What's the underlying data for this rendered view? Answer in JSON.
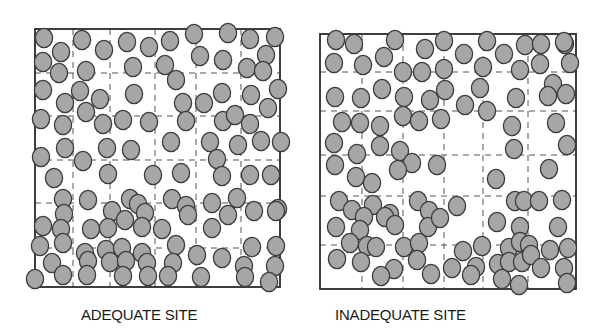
{
  "figure": {
    "panels": [
      {
        "id": "adequate",
        "caption": "ADEQUATE SITE",
        "box": {
          "x": 35,
          "y": 29,
          "w": 245,
          "h": 258
        },
        "grid": {
          "cols": [
            73,
            110,
            155,
            196,
            241
          ],
          "rows": [
            73,
            116,
            160,
            203,
            248
          ]
        },
        "circles": [
          [
            44,
            38
          ],
          [
            61,
            52
          ],
          [
            82,
            40
          ],
          [
            104,
            50
          ],
          [
            127,
            42
          ],
          [
            149,
            47
          ],
          [
            170,
            41
          ],
          [
            194,
            34
          ],
          [
            228,
            33
          ],
          [
            250,
            39
          ],
          [
            275,
            37
          ],
          [
            43,
            62
          ],
          [
            59,
            73
          ],
          [
            86,
            71
          ],
          [
            133,
            67
          ],
          [
            165,
            65
          ],
          [
            200,
            56
          ],
          [
            223,
            60
          ],
          [
            247,
            68
          ],
          [
            266,
            55
          ],
          [
            263,
            71
          ],
          [
            43,
            90
          ],
          [
            65,
            103
          ],
          [
            80,
            91
          ],
          [
            100,
            99
          ],
          [
            134,
            94
          ],
          [
            176,
            80
          ],
          [
            183,
            103
          ],
          [
            204,
            103
          ],
          [
            222,
            93
          ],
          [
            251,
            95
          ],
          [
            278,
            89
          ],
          [
            41,
            119
          ],
          [
            63,
            125
          ],
          [
            86,
            112
          ],
          [
            103,
            124
          ],
          [
            123,
            120
          ],
          [
            149,
            122
          ],
          [
            186,
            121
          ],
          [
            223,
            121
          ],
          [
            235,
            115
          ],
          [
            250,
            124
          ],
          [
            268,
            108
          ],
          [
            65,
            148
          ],
          [
            107,
            148
          ],
          [
            131,
            150
          ],
          [
            171,
            142
          ],
          [
            210,
            142
          ],
          [
            238,
            145
          ],
          [
            261,
            141
          ],
          [
            281,
            142
          ],
          [
            41,
            157
          ],
          [
            83,
            161
          ],
          [
            108,
            174
          ],
          [
            153,
            175
          ],
          [
            181,
            173
          ],
          [
            217,
            159
          ],
          [
            222,
            176
          ],
          [
            250,
            175
          ],
          [
            271,
            175
          ],
          [
            54,
            178
          ],
          [
            63,
            199
          ],
          [
            64,
            214
          ],
          [
            88,
            200
          ],
          [
            112,
            211
          ],
          [
            130,
            199
          ],
          [
            138,
            204
          ],
          [
            145,
            213
          ],
          [
            172,
            199
          ],
          [
            186,
            206
          ],
          [
            212,
            203
          ],
          [
            237,
            198
          ],
          [
            254,
            211
          ],
          [
            278,
            209
          ],
          [
            43,
            226
          ],
          [
            61,
            229
          ],
          [
            91,
            229
          ],
          [
            108,
            228
          ],
          [
            125,
            220
          ],
          [
            142,
            227
          ],
          [
            162,
            229
          ],
          [
            188,
            215
          ],
          [
            212,
            228
          ],
          [
            228,
            215
          ],
          [
            276,
            211
          ],
          [
            40,
            246
          ],
          [
            63,
            243
          ],
          [
            85,
            253
          ],
          [
            106,
            250
          ],
          [
            122,
            248
          ],
          [
            142,
            253
          ],
          [
            176,
            245
          ],
          [
            197,
            255
          ],
          [
            252,
            247
          ],
          [
            276,
            246
          ],
          [
            52,
            263
          ],
          [
            88,
            261
          ],
          [
            110,
            262
          ],
          [
            126,
            261
          ],
          [
            147,
            263
          ],
          [
            173,
            263
          ],
          [
            222,
            258
          ],
          [
            244,
            266
          ],
          [
            275,
            266
          ],
          [
            35,
            279
          ],
          [
            63,
            275
          ],
          [
            87,
            275
          ],
          [
            123,
            276
          ],
          [
            148,
            276
          ],
          [
            168,
            276
          ],
          [
            201,
            277
          ],
          [
            245,
            277
          ],
          [
            269,
            282
          ]
        ]
      },
      {
        "id": "inadequate",
        "caption": "INADEQUATE SITE",
        "box": {
          "x": 320,
          "y": 34,
          "w": 256,
          "h": 255
        },
        "grid": {
          "cols": [
            362,
            403,
            444,
            483,
            528
          ],
          "rows": [
            72,
            111,
            155,
            196,
            245
          ]
        },
        "circles": [
          [
            336,
            40
          ],
          [
            354,
            44
          ],
          [
            395,
            40
          ],
          [
            425,
            49
          ],
          [
            444,
            41
          ],
          [
            487,
            41
          ],
          [
            525,
            45
          ],
          [
            541,
            44
          ],
          [
            565,
            44
          ],
          [
            564,
            42
          ],
          [
            334,
            63
          ],
          [
            363,
            65
          ],
          [
            384,
            57
          ],
          [
            403,
            72
          ],
          [
            422,
            72
          ],
          [
            444,
            69
          ],
          [
            464,
            54
          ],
          [
            483,
            67
          ],
          [
            504,
            54
          ],
          [
            520,
            70
          ],
          [
            540,
            64
          ],
          [
            570,
            63
          ],
          [
            553,
            84
          ],
          [
            335,
            97
          ],
          [
            361,
            98
          ],
          [
            382,
            89
          ],
          [
            404,
            97
          ],
          [
            430,
            100
          ],
          [
            445,
            90
          ],
          [
            465,
            105
          ],
          [
            480,
            88
          ],
          [
            487,
            111
          ],
          [
            516,
            98
          ],
          [
            548,
            96
          ],
          [
            566,
            94
          ],
          [
            342,
            122
          ],
          [
            360,
            123
          ],
          [
            380,
            126
          ],
          [
            403,
            116
          ],
          [
            419,
            121
          ],
          [
            441,
            119
          ],
          [
            512,
            126
          ],
          [
            556,
            123
          ],
          [
            334,
            143
          ],
          [
            357,
            154
          ],
          [
            380,
            146
          ],
          [
            400,
            151
          ],
          [
            412,
            163
          ],
          [
            437,
            165
          ],
          [
            514,
            149
          ],
          [
            567,
            145
          ],
          [
            335,
            165
          ],
          [
            356,
            177
          ],
          [
            372,
            183
          ],
          [
            398,
            170
          ],
          [
            496,
            179
          ],
          [
            549,
            169
          ],
          [
            339,
            201
          ],
          [
            352,
            210
          ],
          [
            373,
            205
          ],
          [
            390,
            214
          ],
          [
            418,
            201
          ],
          [
            429,
            211
          ],
          [
            457,
            206
          ],
          [
            515,
            201
          ],
          [
            524,
            201
          ],
          [
            539,
            201
          ],
          [
            562,
            200
          ],
          [
            336,
            227
          ],
          [
            364,
            217
          ],
          [
            360,
            230
          ],
          [
            385,
            217
          ],
          [
            395,
            225
          ],
          [
            428,
            227
          ],
          [
            440,
            218
          ],
          [
            497,
            222
          ],
          [
            520,
            227
          ],
          [
            558,
            227
          ],
          [
            350,
            243
          ],
          [
            367,
            246
          ],
          [
            376,
            247
          ],
          [
            404,
            247
          ],
          [
            419,
            243
          ],
          [
            463,
            251
          ],
          [
            482,
            246
          ],
          [
            509,
            248
          ],
          [
            520,
            242
          ],
          [
            529,
            245
          ],
          [
            550,
            250
          ],
          [
            568,
            248
          ],
          [
            337,
            259
          ],
          [
            361,
            262
          ],
          [
            394,
            269
          ],
          [
            417,
            260
          ],
          [
            452,
            268
          ],
          [
            476,
            267
          ],
          [
            498,
            264
          ],
          [
            509,
            262
          ],
          [
            522,
            262
          ],
          [
            531,
            255
          ],
          [
            541,
            268
          ],
          [
            564,
            268
          ],
          [
            381,
            276
          ],
          [
            431,
            274
          ],
          [
            471,
            275
          ],
          [
            502,
            279
          ],
          [
            519,
            285
          ],
          [
            567,
            283
          ]
        ]
      }
    ],
    "style": {
      "circle_fill": "#a6a6a6",
      "circle_stroke": "#3c3c3c",
      "box_stroke": "#2a2a2a",
      "grid_stroke": "#555555",
      "caption_color": "#1a1a1a"
    }
  }
}
